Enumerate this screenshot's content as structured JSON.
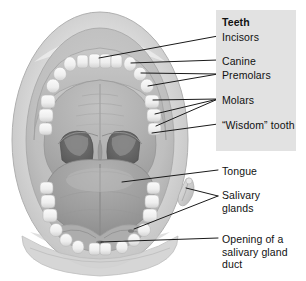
{
  "figure": {
    "colors": {
      "panel_background": "#e2e2e2",
      "page_background": "#ffffff",
      "text": "#111111",
      "leader_line": "#1a1a1a",
      "lip_light": "#dcdcdc",
      "lip_mid": "#c6c6c6",
      "gum_mid": "#b8b8b8",
      "palate": "#a9a9a9",
      "tooth": "#f2f2f2",
      "tongue": "#9b9b9b",
      "oropharynx_dark": "#6b6b6b",
      "throat_darkest": "#4e4e4e"
    }
  },
  "labels": {
    "teeth_heading": "Teeth",
    "incisors": "Incisors",
    "canine": "Canine",
    "premolars": "Premolars",
    "molars": "Molars",
    "wisdom_tooth": "“Wisdom” tooth",
    "tongue": "Tongue",
    "salivary_glands": "Salivary glands",
    "opening_duct": "Opening of a salivary gland duct"
  },
  "callouts": [
    {
      "id": "incisors",
      "label": "Incisors",
      "lines": 1
    },
    {
      "id": "canine",
      "label": "Canine",
      "lines": 1
    },
    {
      "id": "premolars",
      "label": "Premolars",
      "lines": 2
    },
    {
      "id": "molars",
      "label": "Molars",
      "lines": 3
    },
    {
      "id": "wisdom",
      "label": "“Wisdom” tooth",
      "lines": 1
    },
    {
      "id": "tongue",
      "label": "Tongue",
      "lines": 1
    },
    {
      "id": "salivary",
      "label": "Salivary glands",
      "lines": 2
    },
    {
      "id": "opening",
      "label": "Opening of a salivary gland duct",
      "lines": 1
    }
  ]
}
